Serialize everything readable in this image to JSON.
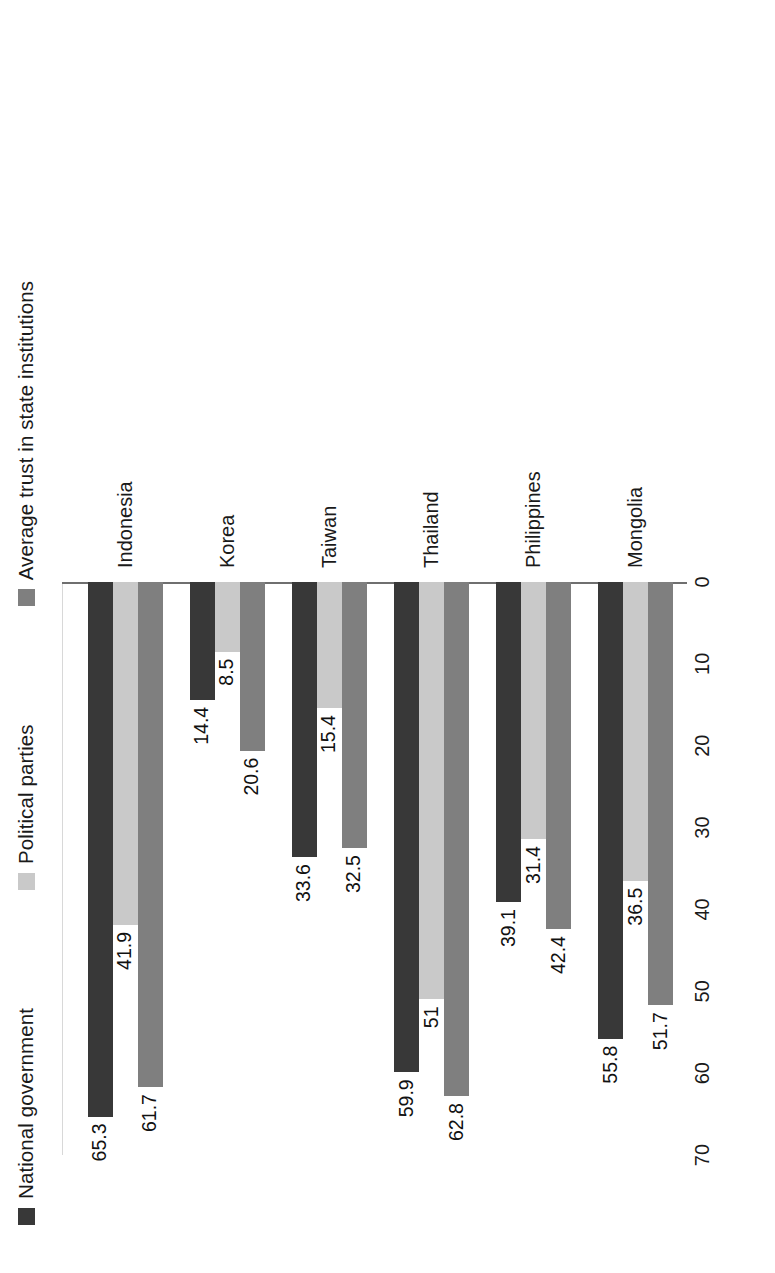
{
  "legend": {
    "items": [
      {
        "label": "National government",
        "color": "#383838",
        "swatch_name": "legend-swatch-national-government"
      },
      {
        "label": "Political parties",
        "color": "#c9c9c9",
        "swatch_name": "legend-swatch-political-parties"
      },
      {
        "label": "Average trust in state institutions",
        "color": "#7f7f7f",
        "swatch_name": "legend-swatch-average-trust"
      }
    ]
  },
  "axis": {
    "ticks": [
      "70",
      "60",
      "50",
      "40",
      "30",
      "20",
      "10",
      "0"
    ]
  },
  "caption": "",
  "chart_data": {
    "type": "bar",
    "title": "",
    "subtitle": "",
    "xlabel": "",
    "ylabel": "",
    "orientation": "vertical",
    "grid": false,
    "legend_position": "top",
    "ylim": [
      0,
      70
    ],
    "ytick_step": 10,
    "categories": [
      "Indonesia",
      "Korea",
      "Taiwan",
      "Thailand",
      "Philippines",
      "Mongolia"
    ],
    "series": [
      {
        "name": "National government",
        "color": "#383838",
        "values": [
          65.3,
          14.4,
          33.6,
          59.9,
          39.1,
          55.8
        ],
        "labels": [
          "65.3",
          "14.4",
          "33.6",
          "59.9",
          "39.1",
          "55.8"
        ]
      },
      {
        "name": "Political parties",
        "color": "#c9c9c9",
        "values": [
          41.9,
          8.5,
          15.4,
          51,
          31.4,
          36.5
        ],
        "labels": [
          "41.9",
          "8.5",
          "15.4",
          "51",
          "31.4",
          "36.5"
        ]
      },
      {
        "name": "Average trust in state institutions",
        "color": "#7f7f7f",
        "values": [
          61.7,
          20.6,
          32.5,
          62.8,
          42.4,
          51.7
        ],
        "labels": [
          "61.7",
          "20.6",
          "32.5",
          "62.8",
          "42.4",
          "51.7"
        ]
      }
    ]
  }
}
